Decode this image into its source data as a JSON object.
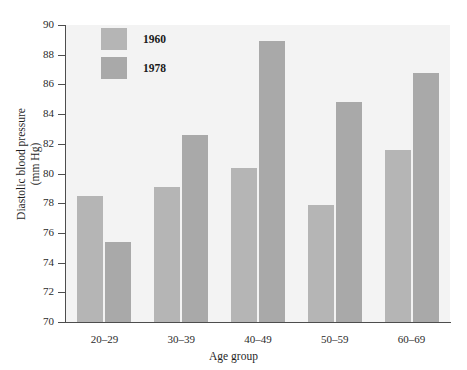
{
  "chart_data": {
    "type": "bar",
    "title": "",
    "xlabel": "Age group",
    "ylabel_line1": "Diastolic blood pressure",
    "ylabel_line2": "(mm Hg)",
    "categories": [
      "20–29",
      "30–39",
      "40–49",
      "50–59",
      "60–69"
    ],
    "series": [
      {
        "name": "1960",
        "color": "#b5b5b5",
        "values": [
          78.5,
          79.1,
          80.35,
          77.9,
          81.6
        ]
      },
      {
        "name": "1978",
        "color": "#a9a9a9",
        "values": [
          75.4,
          82.6,
          88.9,
          84.8,
          86.8
        ]
      }
    ],
    "ylim": [
      70,
      90
    ],
    "yticks": [
      70,
      72,
      74,
      76,
      78,
      80,
      82,
      84,
      86,
      88,
      90
    ],
    "ytick_labels": [
      "70",
      "72",
      "74",
      "76",
      "78",
      "80",
      "82",
      "84",
      "86",
      "88",
      "90"
    ],
    "grid": false,
    "legend_position": "top-left",
    "plot_background": "#f3f3f3",
    "axis_color": "#4d4d4d"
  },
  "legend": {
    "entries": [
      {
        "label": "1960"
      },
      {
        "label": "1978"
      }
    ]
  },
  "axes": {
    "x_title": "Age group",
    "y_title_line1": "Diastolic blood pressure",
    "y_title_line2": "(mm Hg)"
  }
}
